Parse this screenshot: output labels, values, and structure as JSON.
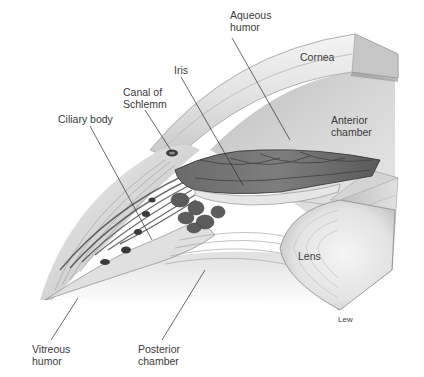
{
  "figure": {
    "labels": [
      {
        "id": "aqueous-humor",
        "text": "Aqueous\nhumor",
        "x": 230,
        "y": 9
      },
      {
        "id": "cornea",
        "text": "Cornea",
        "x": 300,
        "y": 51
      },
      {
        "id": "iris",
        "text": "Iris",
        "x": 174,
        "y": 64
      },
      {
        "id": "canal-of-schlemm",
        "text": "Canal of\nSchlemm",
        "x": 123,
        "y": 86
      },
      {
        "id": "ciliary-body",
        "text": "Ciliary body",
        "x": 58,
        "y": 113
      },
      {
        "id": "anterior-chamber",
        "text": "Anterior\nchamber",
        "x": 331,
        "y": 114
      },
      {
        "id": "lens",
        "text": "Lens",
        "x": 298,
        "y": 250
      },
      {
        "id": "vitreous-humor",
        "text": "Vitreous\nhumor",
        "x": 32,
        "y": 343
      },
      {
        "id": "posterior-chamber",
        "text": "Posterior\nchamber",
        "x": 138,
        "y": 343
      }
    ],
    "credit": {
      "text": "Lew",
      "x": 338,
      "y": 315
    },
    "leader_lines": [
      {
        "for": "aqueous-humor",
        "x1": 232,
        "y1": 38,
        "x2": 290,
        "y2": 140
      },
      {
        "for": "iris",
        "x1": 181,
        "y1": 77,
        "x2": 243,
        "y2": 185
      },
      {
        "for": "canal-of-schlemm",
        "x1": 145,
        "y1": 110,
        "x2": 172,
        "y2": 152
      },
      {
        "for": "ciliary-body",
        "x1": 90,
        "y1": 126,
        "x2": 152,
        "y2": 240
      },
      {
        "for": "vitreous-humor",
        "x1": 51,
        "y1": 340,
        "x2": 78,
        "y2": 298
      },
      {
        "for": "posterior-chamber",
        "x1": 162,
        "y1": 340,
        "x2": 205,
        "y2": 270
      }
    ],
    "colors": {
      "background": "#ffffff",
      "label_text": "#3a3a3a",
      "leader_line": "#2a2a2a",
      "cornea_light": "#e8e8e8",
      "cornea_mid": "#c9c9c9",
      "block_side": "#a9a9a9",
      "tissue_dark": "#4a4a4a",
      "iris_dark": "#555555",
      "lens_light": "#efefef"
    }
  }
}
